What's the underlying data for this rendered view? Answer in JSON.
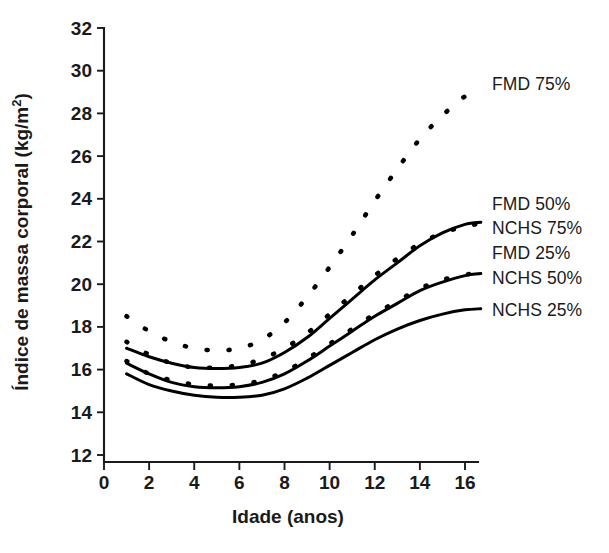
{
  "chart_data": {
    "type": "line",
    "title": "",
    "xlabel": "Idade (anos)",
    "ylabel": "Índice de massa corporal (kg/m2)",
    "ylabel_base": "Índice de massa corporal (kg/m",
    "ylabel_sup": "2",
    "ylabel_close": ")",
    "xlim": [
      0,
      17.3
    ],
    "ylim": [
      12,
      32
    ],
    "grid": false,
    "legend_position": "right-inline",
    "xticks": [
      0,
      2,
      4,
      6,
      8,
      10,
      12,
      14,
      16
    ],
    "xtick_labels": [
      "0",
      "2",
      "4",
      "6",
      "8",
      "10",
      "12",
      "14",
      "16"
    ],
    "yticks": [
      12,
      14,
      16,
      18,
      20,
      22,
      24,
      26,
      28,
      30,
      32
    ],
    "ytick_labels": [
      "12",
      "14",
      "16",
      "18",
      "20",
      "22",
      "24",
      "26",
      "28",
      "30",
      "32"
    ],
    "x": [
      1,
      2,
      3,
      4,
      5,
      6,
      7,
      8,
      9,
      10,
      11,
      12,
      13,
      14,
      15,
      16,
      16.7
    ],
    "series": [
      {
        "name": "FMD 75%",
        "style": "dashed",
        "label": "FMD 75%",
        "values": [
          18.5,
          17.8,
          17.3,
          17.0,
          16.9,
          17.0,
          17.4,
          18.2,
          19.4,
          20.8,
          22.3,
          23.9,
          25.4,
          26.8,
          27.9,
          28.8,
          29.1
        ]
      },
      {
        "name": "FMD 50%",
        "style": "dashed",
        "label": "FMD 50%",
        "values": [
          17.3,
          16.7,
          16.3,
          16.1,
          16.1,
          16.2,
          16.5,
          17.0,
          17.7,
          18.6,
          19.5,
          20.4,
          21.2,
          21.9,
          22.4,
          22.7,
          22.85
        ]
      },
      {
        "name": "NCHS 75%",
        "style": "solid",
        "label": "NCHS 75%",
        "values": [
          17.0,
          16.6,
          16.3,
          16.1,
          16.05,
          16.1,
          16.3,
          16.8,
          17.5,
          18.4,
          19.3,
          20.2,
          21.0,
          21.8,
          22.4,
          22.8,
          22.9
        ]
      },
      {
        "name": "FMD 25%",
        "style": "dashed",
        "label": "FMD 25%",
        "values": [
          16.4,
          15.8,
          15.5,
          15.3,
          15.25,
          15.3,
          15.5,
          15.9,
          16.5,
          17.2,
          17.9,
          18.6,
          19.2,
          19.8,
          20.2,
          20.45,
          20.5
        ]
      },
      {
        "name": "NCHS 50%",
        "style": "solid",
        "label": "NCHS 50%",
        "values": [
          16.3,
          15.8,
          15.4,
          15.2,
          15.15,
          15.2,
          15.4,
          15.8,
          16.4,
          17.1,
          17.8,
          18.5,
          19.1,
          19.7,
          20.1,
          20.4,
          20.5
        ]
      },
      {
        "name": "NCHS 25%",
        "style": "solid",
        "label": "NCHS 25%",
        "values": [
          15.8,
          15.3,
          15.0,
          14.8,
          14.7,
          14.7,
          14.8,
          15.1,
          15.6,
          16.2,
          16.8,
          17.4,
          17.9,
          18.3,
          18.6,
          18.8,
          18.85
        ]
      }
    ]
  }
}
